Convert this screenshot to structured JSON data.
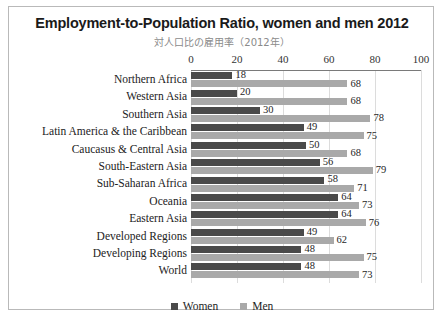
{
  "chart_data": {
    "type": "bar",
    "orientation": "horizontal",
    "title": "Employment-to-Population Ratio, women and men 2012",
    "subtitle": "対人口比の雇用率（2012年）",
    "xlabel": "",
    "ylabel": "",
    "xlim": [
      0,
      100
    ],
    "xticks": [
      0,
      20,
      40,
      60,
      80,
      100
    ],
    "tick_labels": [
      "0",
      "20",
      "40",
      "60",
      "80",
      "100"
    ],
    "grid": true,
    "legend_position": "bottom",
    "categories": [
      "Northern Africa",
      "Western Asia",
      "Southern Asia",
      "Latin America & the Caribbean",
      "Caucasus & Central Asia",
      "South-Eastern Asia",
      "Sub-Saharan Africa",
      "Oceania",
      "Eastern Asia",
      "Developed Regions",
      "Developing Regions",
      "World"
    ],
    "series": [
      {
        "name": "Women",
        "color": "#4a4a4a",
        "values": [
          18,
          20,
          30,
          49,
          50,
          56,
          58,
          64,
          64,
          49,
          48,
          48
        ]
      },
      {
        "name": "Men",
        "color": "#a9a9a9",
        "values": [
          68,
          68,
          78,
          75,
          68,
          79,
          71,
          73,
          76,
          62,
          75,
          73
        ]
      }
    ]
  },
  "legend": {
    "items": [
      {
        "label": "Women",
        "color": "#4a4a4a"
      },
      {
        "label": "Men",
        "color": "#a9a9a9"
      }
    ]
  }
}
